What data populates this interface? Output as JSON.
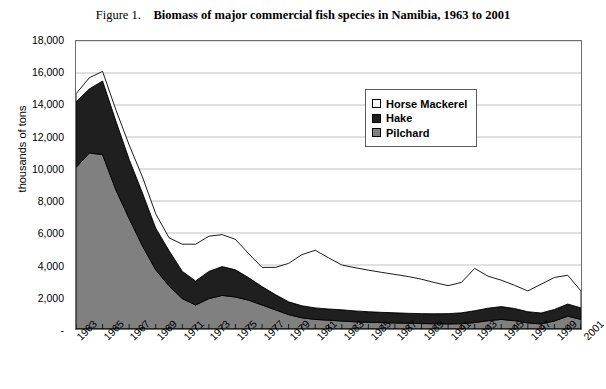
{
  "title": {
    "figure_label": "Figure 1.",
    "text": "Biomass of major commercial fish species in Namibia, 1963 to 2001"
  },
  "axes": {
    "ylabel": "thousands of tons",
    "xlabel": "",
    "y_ticklabels": [
      "18,000",
      "16,000",
      "14,000",
      "12,000",
      "10,000",
      "8,000",
      "6,000",
      "4,000",
      "2,000",
      "-"
    ],
    "x_ticklabels": [
      "1963",
      "1965",
      "1967",
      "1969",
      "1971",
      "1973",
      "1975",
      "1977",
      "1979",
      "1981",
      "1983",
      "1985",
      "1987",
      "1989",
      "1991",
      "1993",
      "1995",
      "1997",
      "1999",
      "2001"
    ]
  },
  "legend": {
    "position": "inside-top-right",
    "entries": [
      {
        "label": "Horse Mackerel",
        "color": "#ffffff"
      },
      {
        "label": "Hake",
        "color": "#1f1f1f"
      },
      {
        "label": "Pilchard",
        "color": "#808080"
      }
    ]
  },
  "chart_data": {
    "type": "area",
    "stacked": true,
    "xlabel": "",
    "ylabel": "thousands of tons",
    "ylim": [
      0,
      18000
    ],
    "ytick_step": 2000,
    "grid": true,
    "grid_axis": "y",
    "x": [
      1963,
      1964,
      1965,
      1966,
      1967,
      1968,
      1969,
      1970,
      1971,
      1972,
      1973,
      1974,
      1975,
      1976,
      1977,
      1978,
      1979,
      1980,
      1981,
      1982,
      1983,
      1984,
      1985,
      1986,
      1987,
      1988,
      1989,
      1990,
      1991,
      1992,
      1993,
      1994,
      1995,
      1996,
      1997,
      1998,
      1999,
      2000,
      2001
    ],
    "series": [
      {
        "name": "Pilchard",
        "color": "#808080",
        "stack_order": 1,
        "values": [
          10100,
          11000,
          10900,
          8700,
          6900,
          5200,
          3700,
          2700,
          1900,
          1500,
          1900,
          2100,
          2000,
          1800,
          1500,
          1200,
          900,
          700,
          600,
          550,
          500,
          450,
          420,
          400,
          380,
          360,
          340,
          330,
          320,
          330,
          400,
          520,
          600,
          520,
          380,
          320,
          500,
          800,
          600
        ]
      },
      {
        "name": "Hake",
        "color": "#1f1f1f",
        "stack_order": 2,
        "values": [
          4100,
          4000,
          4600,
          4300,
          3700,
          3300,
          2600,
          2200,
          1700,
          1500,
          1700,
          1800,
          1700,
          1400,
          1150,
          950,
          800,
          750,
          720,
          700,
          700,
          680,
          660,
          640,
          630,
          620,
          620,
          620,
          640,
          680,
          740,
          780,
          800,
          760,
          700,
          680,
          720,
          760,
          720
        ]
      },
      {
        "name": "Horse Mackerel",
        "color": "#ffffff",
        "stack_order": 3,
        "values": [
          500,
          700,
          600,
          700,
          900,
          1000,
          900,
          800,
          1700,
          2300,
          2200,
          2000,
          1900,
          1500,
          1200,
          1700,
          2400,
          3200,
          3600,
          3200,
          2800,
          2700,
          2600,
          2500,
          2400,
          2300,
          2150,
          1950,
          1750,
          1900,
          2650,
          2000,
          1650,
          1450,
          1300,
          1800,
          2000,
          1800,
          1050
        ]
      }
    ],
    "totals": [
      14700,
      15700,
      16100,
      13700,
      11500,
      9500,
      7200,
      5700,
      5300,
      5300,
      5800,
      5900,
      5600,
      4700,
      3850,
      3850,
      4100,
      4650,
      4920,
      4450,
      4000,
      3830,
      3680,
      3540,
      3410,
      3280,
      3110,
      2900,
      2710,
      2910,
      3790,
      3300,
      3050,
      2730,
      2380,
      2800,
      3220,
      3360,
      2370
    ]
  }
}
